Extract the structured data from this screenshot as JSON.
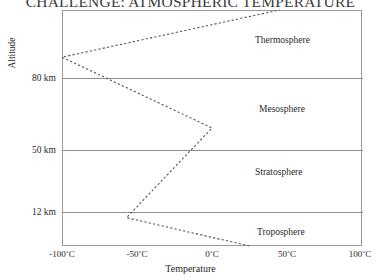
{
  "title": "CHALLENGE: ATMOSPHERIC TEMPERATURE",
  "axes": {
    "y_title": "Altitude",
    "x_title": "Temperature"
  },
  "chart_data": {
    "type": "line",
    "title": "CHALLENGE: ATMOSPHERIC TEMPERATURE",
    "xlabel": "Temperature",
    "ylabel": "Altitude",
    "xlim": [
      -100,
      100
    ],
    "ylim": [
      0,
      100
    ],
    "x_unit": "°C",
    "y_unit": "km",
    "grid": false,
    "legend": "none",
    "line_style": "dashed",
    "line_color": "#555555",
    "xticks": [
      -100,
      -50,
      0,
      50,
      100
    ],
    "xticklabels": [
      "-100˚C",
      "-50˚C",
      "0˚C",
      "50˚C",
      "100˚C"
    ],
    "yticks": [
      12,
      50,
      80
    ],
    "yticklabels": [
      "12 km",
      "50 km",
      "80 km"
    ],
    "series": [
      {
        "name": "Atmospheric temperature profile",
        "x": [
          25,
          -57,
          0,
          -100,
          45
        ],
        "y": [
          0,
          12,
          50,
          80,
          100
        ]
      }
    ],
    "layer_bands": [
      {
        "name": "Troposphere",
        "y_range": [
          0,
          12
        ]
      },
      {
        "name": "Stratosphere",
        "y_range": [
          12,
          50
        ]
      },
      {
        "name": "Mesosphere",
        "y_range": [
          50,
          80
        ]
      },
      {
        "name": "Thermosphere",
        "y_range": [
          80,
          100
        ]
      }
    ],
    "annotations": [
      "Thermosphere",
      "Mesosphere",
      "Stratosphere",
      "Troposphere"
    ]
  }
}
